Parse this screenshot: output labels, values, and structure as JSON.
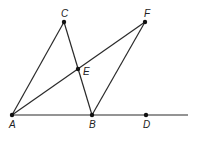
{
  "diagram": {
    "type": "geometry",
    "points": [
      {
        "name": "A",
        "x": 12,
        "y": 115,
        "label_dx": -3,
        "label_dy": 13
      },
      {
        "name": "B",
        "x": 92,
        "y": 115,
        "label_dx": -3,
        "label_dy": 13
      },
      {
        "name": "D",
        "x": 146,
        "y": 115,
        "label_dx": -3,
        "label_dy": 13
      },
      {
        "name": "C",
        "x": 64,
        "y": 22,
        "label_dx": -3,
        "label_dy": -5
      },
      {
        "name": "F",
        "x": 145,
        "y": 22,
        "label_dx": -1,
        "label_dy": -5
      },
      {
        "name": "E",
        "x": 78,
        "y": 69,
        "label_dx": 5,
        "label_dy": 6
      }
    ],
    "segments": [
      {
        "from": "A",
        "to": "C"
      },
      {
        "from": "C",
        "to": "B"
      },
      {
        "from": "A",
        "to": "F"
      },
      {
        "from": "F",
        "to": "B"
      }
    ],
    "ray": {
      "from": "A",
      "to_x": 188,
      "to_y": 115
    },
    "line_color": "#2a2a2a",
    "point_color": "#111111"
  }
}
